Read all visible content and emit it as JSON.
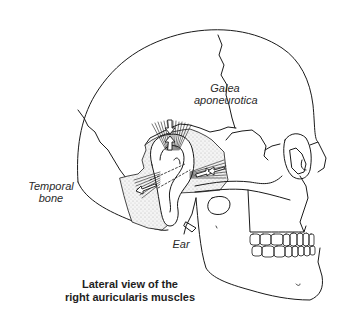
{
  "diagram": {
    "labels": {
      "galea_line1": "Galea",
      "galea_line2": "aponeurotica",
      "temporal_line1": "Temporal",
      "temporal_line2": "bone",
      "ear": "Ear"
    },
    "caption": {
      "line1": "Lateral view of the",
      "line2": "right auricularis muscles"
    },
    "colors": {
      "stroke": "#1a1a1a",
      "stipple": "#c8c8c8",
      "background": "#ffffff"
    }
  }
}
